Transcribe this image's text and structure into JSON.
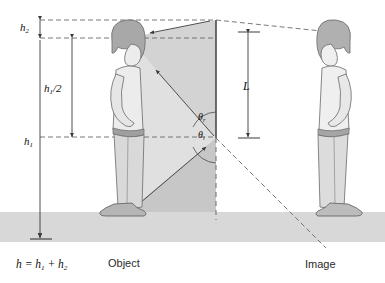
{
  "figure": {
    "background": "#ffffff",
    "ground_color": "#d6d6d6",
    "cone_fill": "#cfcfcf",
    "line_color": "#3a3a3a",
    "dash_color": "#555555",
    "figure_fill": "#e9e9e9",
    "hair_fill": "#9a9a9a"
  },
  "labels": {
    "h2": "h",
    "h2_sub": "2",
    "h_half": "h",
    "h_half_sub": "1",
    "h_half_tail": "/2",
    "h1": "h",
    "h1_sub": "1",
    "L": "L",
    "theta_r": "θ",
    "theta_r_sub": "r",
    "theta_i": "θ",
    "theta_i_sub": "i",
    "object": "Object",
    "image": "Image",
    "equation": "h = h",
    "equation_sub1": "1",
    "equation_mid": " + h",
    "equation_sub2": "2"
  },
  "geometry": {
    "mirror_x": 216,
    "mirror_top_y": 20,
    "mirror_bottom_y": 138,
    "ground_y": 212,
    "object_x": 128,
    "image_x": 330,
    "eye_y": 38,
    "foot_y": 212,
    "waist_y": 133,
    "h1_value": "h1",
    "h2_value": "h2",
    "L_span_top": 33,
    "L_span_bottom": 137
  },
  "rays": [
    {
      "name": "top-ray-incident",
      "from": "head-top",
      "to": "mirror-top",
      "style": "dashed"
    },
    {
      "name": "top-ray-reflected",
      "from": "mirror-top",
      "to": "eye",
      "style": "dashed"
    },
    {
      "name": "sight-line-head",
      "from": "eye",
      "to": "image-head",
      "style": "dashed"
    },
    {
      "name": "foot-ray-incident",
      "from": "feet",
      "to": "mirror-bottom",
      "style": "solid"
    },
    {
      "name": "foot-ray-reflected",
      "from": "mirror-bottom",
      "to": "eye",
      "style": "solid"
    },
    {
      "name": "sight-line-feet",
      "from": "mirror-bottom",
      "to": "image-feet",
      "style": "dashed"
    },
    {
      "name": "normal-line",
      "from": "mirror-bottom",
      "to": "ground",
      "style": "dashed"
    }
  ]
}
